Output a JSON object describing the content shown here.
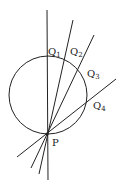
{
  "diagram": {
    "stroke_color": "#222222",
    "background": "#ffffff",
    "circle": {
      "cx": 48,
      "cy": 95,
      "r": 39
    },
    "point_P": {
      "x": 47,
      "y": 134,
      "label": "P"
    },
    "lines": [
      {
        "name": "line-PQ1",
        "x1": 48,
        "y1": 180,
        "x2": 47,
        "y2": 10
      },
      {
        "name": "line-PQ2",
        "x1": 39,
        "y1": 174,
        "x2": 73,
        "y2": 20
      },
      {
        "name": "line-PQ3",
        "x1": 31,
        "y1": 168,
        "x2": 94,
        "y2": 35
      },
      {
        "name": "line-PQ4",
        "x1": 17,
        "y1": 157,
        "x2": 116,
        "y2": 79
      }
    ],
    "labels": {
      "Q1": {
        "base": "Q",
        "sub": "1"
      },
      "Q2": {
        "base": "Q",
        "sub": "2"
      },
      "Q3": {
        "base": "Q",
        "sub": "3"
      },
      "Q4": {
        "base": "Q",
        "sub": "4"
      },
      "P": "P"
    }
  }
}
